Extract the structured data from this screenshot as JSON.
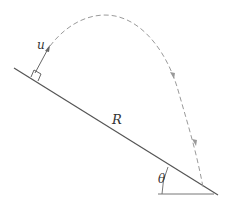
{
  "diagram": {
    "type": "projectile-on-incline",
    "labels": {
      "velocity": "u",
      "range": "R",
      "angle": "θ"
    },
    "colors": {
      "slope": "#555555",
      "trajectory": "#999999",
      "shade": "#c8c8c8",
      "text": "#333333"
    }
  }
}
